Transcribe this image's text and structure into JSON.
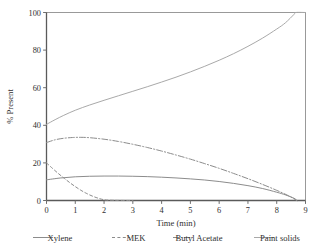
{
  "chart_data": {
    "type": "line",
    "title": "",
    "xlabel": "Time (min)",
    "ylabel": "% Present",
    "xlim": [
      0,
      9
    ],
    "ylim": [
      0,
      100
    ],
    "xticks": [
      "0",
      "1",
      "2",
      "3",
      "4",
      "5",
      "6",
      "7",
      "8",
      "9"
    ],
    "yticks": [
      "0",
      "20",
      "40",
      "60",
      "80",
      "100"
    ],
    "grid": false,
    "legend_position": "below",
    "series": [
      {
        "name": "Xylene",
        "style": "solid",
        "color": "#8c8c8c",
        "x": [
          0,
          0.5,
          1,
          1.5,
          2,
          2.5,
          3,
          3.5,
          4,
          4.5,
          5,
          5.5,
          6,
          6.5,
          7,
          7.5,
          8,
          8.3,
          8.6,
          8.7
        ],
        "y": [
          11.0,
          12.0,
          12.6,
          12.9,
          13.0,
          13.0,
          12.9,
          12.7,
          12.4,
          12.0,
          11.5,
          10.9,
          10.1,
          9.1,
          7.9,
          6.4,
          4.4,
          3.0,
          1.2,
          0.0
        ]
      },
      {
        "name": "MEK",
        "style": "dashed",
        "color": "#8c8c8c",
        "x": [
          0,
          0.2,
          0.4,
          0.6,
          0.8,
          1.0,
          1.2,
          1.4,
          1.6,
          1.8,
          2.0,
          2.2,
          2.5,
          3.0
        ],
        "y": [
          20.0,
          17.2,
          14.5,
          12.0,
          9.6,
          7.4,
          5.4,
          3.7,
          2.3,
          1.2,
          0.4,
          0.15,
          0.05,
          0.0
        ]
      },
      {
        "name": "Butyl Acetate",
        "style": "dashdot",
        "color": "#8c8c8c",
        "x": [
          0,
          0.3,
          0.6,
          0.9,
          1.2,
          1.5,
          2.0,
          2.5,
          3.0,
          3.5,
          4.0,
          4.5,
          5.0,
          5.5,
          6.0,
          6.5,
          7.0,
          7.5,
          8.0,
          8.4,
          8.7
        ],
        "y": [
          30.8,
          32.3,
          33.1,
          33.5,
          33.6,
          33.4,
          32.6,
          31.4,
          29.9,
          28.2,
          26.3,
          24.2,
          22.0,
          19.6,
          17.1,
          14.4,
          11.6,
          8.6,
          5.4,
          2.6,
          0.0
        ]
      },
      {
        "name": "Paint solids",
        "style": "solid",
        "color": "#a9a9a9",
        "x": [
          0,
          0.3,
          0.6,
          1.0,
          1.5,
          2.0,
          2.5,
          3.0,
          3.5,
          4.0,
          4.5,
          5.0,
          5.5,
          6.0,
          6.5,
          7.0,
          7.5,
          8.0,
          8.3,
          8.6,
          8.65,
          9.0
        ],
        "y": [
          40.5,
          43.0,
          45.3,
          48.0,
          50.8,
          53.3,
          55.7,
          58.1,
          60.5,
          63.0,
          65.6,
          68.4,
          71.4,
          74.6,
          78.1,
          82.0,
          86.3,
          91.2,
          94.5,
          99.0,
          100.0,
          100.0
        ]
      }
    ]
  },
  "legend": {
    "items": [
      {
        "label": "Xylene"
      },
      {
        "label": "MEK"
      },
      {
        "label": "Butyl Acetate"
      },
      {
        "label": "Paint solids"
      }
    ]
  },
  "axes": {
    "x_title": "Time (min)",
    "y_title": "% Present"
  }
}
